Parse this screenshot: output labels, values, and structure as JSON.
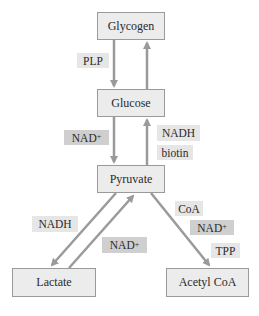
{
  "diagram": {
    "nodes": {
      "glycogen": "Glycogen",
      "glucose": "Glucose",
      "pyruvate": "Pyruvate",
      "lactate": "Lactate",
      "acetyl_coa": "Acetyl CoA"
    },
    "cofactors": {
      "glycogen_to_glucose": [
        "PLP"
      ],
      "glucose_to_pyruvate": [
        {
          "base": "NAD",
          "sup": "+"
        }
      ],
      "pyruvate_to_glucose": [
        "NADH",
        "biotin"
      ],
      "pyruvate_to_lactate": [
        "NADH"
      ],
      "lactate_to_pyruvate": [
        {
          "base": "NAD",
          "sup": "+"
        }
      ],
      "pyruvate_to_acetyl_coa": [
        "CoA",
        {
          "base": "NAD",
          "sup": "+"
        },
        "TPP"
      ]
    },
    "edges": [
      {
        "from": "Glycogen",
        "to": "Glucose"
      },
      {
        "from": "Glucose",
        "to": "Glycogen"
      },
      {
        "from": "Glucose",
        "to": "Pyruvate"
      },
      {
        "from": "Pyruvate",
        "to": "Glucose"
      },
      {
        "from": "Pyruvate",
        "to": "Lactate"
      },
      {
        "from": "Lactate",
        "to": "Pyruvate"
      },
      {
        "from": "Pyruvate",
        "to": "Acetyl CoA"
      }
    ],
    "colors": {
      "arrow": "#9a9a9a",
      "node_fill": "#ececec",
      "label_light": "#e6e6e6",
      "label_dark": "#cfcfcf"
    }
  }
}
